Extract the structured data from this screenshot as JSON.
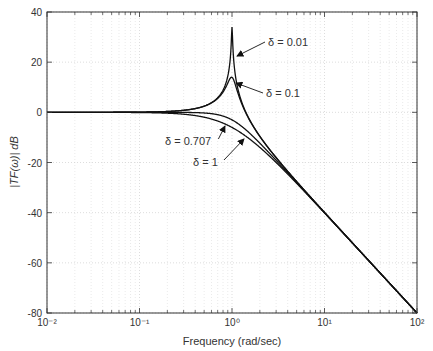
{
  "chart_data": {
    "type": "line",
    "title": "",
    "xlabel": "Frequency (rad/sec)",
    "ylabel": "|TF(ω)| dB",
    "xscale": "log",
    "xlim": [
      0.01,
      100
    ],
    "ylim": [
      -80,
      40
    ],
    "grid": true,
    "x_ticks": [
      "10⁻²",
      "10⁻¹",
      "10⁰",
      "10¹",
      "10²"
    ],
    "y_ticks": [
      40,
      20,
      0,
      -20,
      -40,
      -60,
      -80
    ],
    "model": "second-order low-pass: 1/(1-(ω)^2 + j2δω)",
    "series": [
      {
        "name": "δ = 0.01",
        "delta": 0.01,
        "peak_db": 34
      },
      {
        "name": "δ = 0.1",
        "delta": 0.1,
        "peak_db": 14
      },
      {
        "name": "δ = 0.707",
        "delta": 0.707,
        "peak_db": 0
      },
      {
        "name": "δ = 1",
        "delta": 1.0,
        "peak_db": 0
      }
    ],
    "annotations": [
      {
        "text": "δ = 0.01",
        "label_x": 268,
        "label_y": 46,
        "arrow_to": [
          237,
          56
        ]
      },
      {
        "text": "δ = 0.1",
        "label_x": 266,
        "label_y": 97,
        "arrow_to": [
          236,
          83
        ]
      },
      {
        "text": "δ = 0.707",
        "label_x": 165,
        "label_y": 145,
        "arrow_to": [
          225,
          126
        ]
      },
      {
        "text": "δ = 1",
        "label_x": 193,
        "label_y": 166,
        "arrow_to": [
          244,
          139
        ]
      }
    ]
  }
}
